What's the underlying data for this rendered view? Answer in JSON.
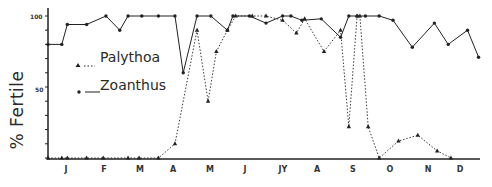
{
  "chart_data": {
    "type": "line",
    "title": "",
    "xlabel": "",
    "ylabel": "% Fertile",
    "ylim": [
      0,
      100
    ],
    "yticks": [
      "100",
      "50"
    ],
    "xticks": [
      "J",
      "F",
      "M",
      "A",
      "M",
      "J",
      "JY",
      "A",
      "S",
      "O",
      "N",
      "D"
    ],
    "grid": false,
    "legend_position": "upper-left inside",
    "series": [
      {
        "name": "Palythoa",
        "style": "dotted",
        "marker": "triangle",
        "points": [
          [
            0.0,
            0
          ],
          [
            0.5,
            0
          ],
          [
            0.7,
            0
          ],
          [
            1.4,
            0
          ],
          [
            2.0,
            0
          ],
          [
            2.9,
            0
          ],
          [
            3.3,
            0
          ],
          [
            4.0,
            0
          ],
          [
            4.6,
            10
          ],
          [
            5.4,
            90
          ],
          [
            5.8,
            40
          ],
          [
            6.1,
            75
          ],
          [
            6.5,
            90
          ],
          [
            6.8,
            100
          ],
          [
            7.4,
            100
          ],
          [
            7.9,
            100
          ],
          [
            8.5,
            97
          ],
          [
            9.0,
            88
          ],
          [
            9.3,
            98
          ],
          [
            10.0,
            75
          ],
          [
            10.6,
            90
          ],
          [
            10.9,
            22
          ],
          [
            11.2,
            100
          ],
          [
            11.3,
            100
          ],
          [
            11.6,
            22
          ],
          [
            12.0,
            0
          ],
          [
            12.7,
            12
          ],
          [
            13.4,
            16
          ],
          [
            14.1,
            5
          ],
          [
            14.6,
            0
          ]
        ]
      },
      {
        "name": "Zoanthus",
        "style": "solid",
        "marker": "circle",
        "points": [
          [
            0.0,
            80
          ],
          [
            0.5,
            80
          ],
          [
            0.7,
            94
          ],
          [
            1.4,
            94
          ],
          [
            2.1,
            100
          ],
          [
            2.6,
            90
          ],
          [
            2.9,
            100
          ],
          [
            3.4,
            100
          ],
          [
            4.0,
            100
          ],
          [
            4.6,
            100
          ],
          [
            4.9,
            60
          ],
          [
            5.4,
            100
          ],
          [
            5.9,
            100
          ],
          [
            6.5,
            90
          ],
          [
            6.7,
            100
          ],
          [
            7.3,
            100
          ],
          [
            7.9,
            95
          ],
          [
            8.5,
            100
          ],
          [
            8.8,
            100
          ],
          [
            9.2,
            97
          ],
          [
            9.9,
            98
          ],
          [
            10.6,
            85
          ],
          [
            10.9,
            100
          ],
          [
            11.2,
            100
          ],
          [
            11.5,
            100
          ],
          [
            12.0,
            100
          ],
          [
            12.5,
            97
          ],
          [
            13.2,
            78
          ],
          [
            14.0,
            95
          ],
          [
            14.5,
            80
          ],
          [
            15.2,
            90
          ],
          [
            15.6,
            71
          ]
        ]
      }
    ]
  },
  "legend": {
    "palythoa": "Palythoa",
    "zoanthus": "Zoanthus"
  },
  "axis": {
    "ylabel": "% Fertile",
    "ytick_100": "100",
    "ytick_50": "50",
    "months": [
      "J",
      "F",
      "M",
      "A",
      "M",
      "J",
      "JY",
      "A",
      "S",
      "O",
      "N",
      "D"
    ]
  }
}
